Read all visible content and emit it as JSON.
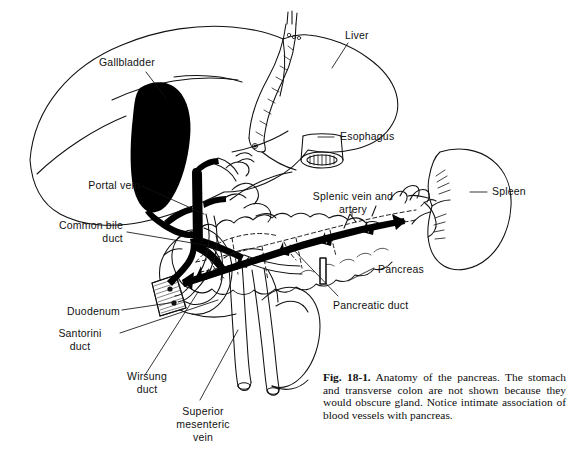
{
  "figure": {
    "number": "Fig. 18-1.",
    "caption_text": "Anatomy of the pancreas. The stomach and transverse colon are not shown because they would obscure gland. Notice intimate association of blood vessels with pancreas.",
    "background_color": "#ffffff",
    "ink_color": "#111111",
    "fill_color": "#000000"
  },
  "labels": {
    "gallbladder": "Gallbladder",
    "liver": "Liver",
    "esophagus": "Esophagus",
    "spleen": "Spleen",
    "portal_vein": "Portal vein",
    "common_bile_duct_l1": "Common bile",
    "common_bile_duct_l2": "duct",
    "splenic_vessels_l1": "Splenic vein and",
    "splenic_vessels_l2": "artery",
    "pancreas": "Pancreas",
    "pancreatic_duct": "Pancreatic duct",
    "duodenum": "Duodenum",
    "santorini_duct_l1": "Santorini",
    "santorini_duct_l2": "duct",
    "wirsung_duct_l1": "Wirsung",
    "wirsung_duct_l2": "duct",
    "smv_l1": "Superior",
    "smv_l2": "mesenteric",
    "smv_l3": "vein"
  }
}
